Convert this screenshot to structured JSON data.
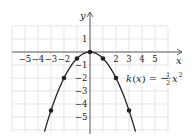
{
  "chart_data": {
    "type": "line",
    "title": "",
    "xlabel": "x",
    "ylabel": "y",
    "xlim": [
      -6,
      6
    ],
    "ylim": [
      -6,
      2
    ],
    "grid": true,
    "x_ticks": [
      -5,
      -4,
      -3,
      -2,
      2,
      3,
      4,
      5
    ],
    "y_ticks": [
      1,
      -1,
      -2,
      -3,
      -4,
      -5
    ],
    "series": [
      {
        "name": "k(x) = -1/2 x^2",
        "function": "-0.5*x*x",
        "x_domain": [
          -3.5,
          3.5
        ],
        "color": "#222222",
        "points": [
          {
            "x": -3,
            "y": -4.5
          },
          {
            "x": -2,
            "y": -2
          },
          {
            "x": -1,
            "y": -0.5
          },
          {
            "x": 0,
            "y": 0
          },
          {
            "x": 1,
            "y": -0.5
          },
          {
            "x": 2,
            "y": -2
          },
          {
            "x": 3,
            "y": -4.5
          }
        ]
      }
    ],
    "annotation": {
      "lhs": "k(x) = −",
      "frac_num": "1",
      "frac_den": "2",
      "var": "x",
      "exp": "2",
      "anchor": {
        "x": 2.7,
        "y": -2
      }
    }
  },
  "colors": {
    "grid": "#d9d9d9",
    "axis": "#555555",
    "curve": "#222222"
  }
}
